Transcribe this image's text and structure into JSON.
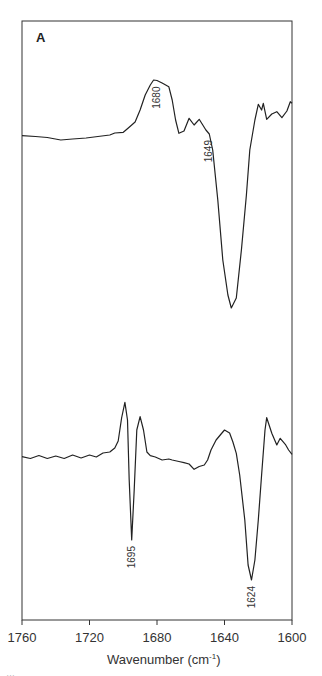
{
  "chart_data": {
    "type": "line",
    "title": "",
    "panel_label": "A",
    "xlabel": "Wavenumber (cm⁻¹)",
    "xlabel_main": "Wavenumber (cm",
    "xlabel_sup": "-1",
    "xlabel_close": ")",
    "ylabel": "",
    "xlim": [
      1760,
      1600
    ],
    "x_reversed": true,
    "xticks": [
      1760,
      1720,
      1680,
      1640,
      1600
    ],
    "xtick_labels": [
      "1760",
      "1720",
      "1680",
      "1640",
      "1600"
    ],
    "grid": false,
    "legend": null,
    "y_units": "relative absorbance (arbitrary, pixel-scaled; up = positive)",
    "series": [
      {
        "name": "upper spectrum",
        "points": [
          [
            1760,
            135.7
          ],
          [
            1752,
            136.5
          ],
          [
            1745,
            137.5
          ],
          [
            1737,
            140
          ],
          [
            1730,
            139
          ],
          [
            1722,
            138
          ],
          [
            1715,
            136.5
          ],
          [
            1708,
            135
          ],
          [
            1705,
            133
          ],
          [
            1700,
            132.3
          ],
          [
            1697,
            128
          ],
          [
            1693,
            122
          ],
          [
            1690,
            110
          ],
          [
            1687,
            95
          ],
          [
            1684,
            85
          ],
          [
            1682,
            80
          ],
          [
            1680,
            80.5
          ],
          [
            1677,
            83
          ],
          [
            1673,
            86.7
          ],
          [
            1671,
            100
          ],
          [
            1669,
            120
          ],
          [
            1667,
            133.3
          ],
          [
            1664,
            131
          ],
          [
            1661,
            118.3
          ],
          [
            1658,
            125
          ],
          [
            1655,
            119.3
          ],
          [
            1651,
            130
          ],
          [
            1649,
            134
          ],
          [
            1647,
            150
          ],
          [
            1644,
            200
          ],
          [
            1641,
            260
          ],
          [
            1638,
            295
          ],
          [
            1636,
            308
          ],
          [
            1633,
            298
          ],
          [
            1630,
            250
          ],
          [
            1627,
            195
          ],
          [
            1625,
            150
          ],
          [
            1622,
            120
          ],
          [
            1620,
            104.3
          ],
          [
            1618,
            110
          ],
          [
            1617,
            103.3
          ],
          [
            1615,
            119.3
          ],
          [
            1612,
            114
          ],
          [
            1609,
            111.7
          ],
          [
            1606,
            117.7
          ],
          [
            1603,
            111
          ],
          [
            1601,
            101.7
          ],
          [
            1600,
            103.3
          ]
        ]
      },
      {
        "name": "lower spectrum",
        "points": [
          [
            1760,
            456.7
          ],
          [
            1755,
            458.5
          ],
          [
            1750,
            455.5
          ],
          [
            1745,
            458.5
          ],
          [
            1740,
            456
          ],
          [
            1735,
            458.5
          ],
          [
            1730,
            455
          ],
          [
            1725,
            458
          ],
          [
            1720,
            455
          ],
          [
            1716,
            457
          ],
          [
            1712,
            453
          ],
          [
            1708,
            452
          ],
          [
            1705,
            448
          ],
          [
            1703,
            441
          ],
          [
            1701,
            418
          ],
          [
            1699,
            402.3
          ],
          [
            1697.5,
            420
          ],
          [
            1696.5,
            480
          ],
          [
            1695,
            540
          ],
          [
            1693.5,
            490
          ],
          [
            1692,
            430
          ],
          [
            1690,
            416.7
          ],
          [
            1688,
            430
          ],
          [
            1686,
            452
          ],
          [
            1684,
            455.7
          ],
          [
            1681,
            457
          ],
          [
            1677,
            460
          ],
          [
            1673,
            459
          ],
          [
            1671,
            460
          ],
          [
            1667,
            461.5
          ],
          [
            1664,
            462.7
          ],
          [
            1661,
            464
          ],
          [
            1658,
            469.3
          ],
          [
            1655,
            466.5
          ],
          [
            1652,
            465
          ],
          [
            1650,
            460
          ],
          [
            1648,
            450
          ],
          [
            1645,
            440
          ],
          [
            1642,
            434
          ],
          [
            1640,
            430
          ],
          [
            1637,
            433
          ],
          [
            1635,
            442
          ],
          [
            1633,
            453.3
          ],
          [
            1631,
            475
          ],
          [
            1628,
            520
          ],
          [
            1626,
            565
          ],
          [
            1624,
            580
          ],
          [
            1622,
            560
          ],
          [
            1620,
            520
          ],
          [
            1618,
            475
          ],
          [
            1616,
            430
          ],
          [
            1615,
            417.7
          ],
          [
            1612,
            433.3
          ],
          [
            1609,
            445
          ],
          [
            1607,
            438.3
          ],
          [
            1604,
            444.3
          ],
          [
            1602,
            450
          ],
          [
            1600,
            454.3
          ]
        ]
      }
    ],
    "annotations": [
      {
        "text": "1680",
        "series": "upper spectrum",
        "x": 1680,
        "kind": "band minimum",
        "rotated": true
      },
      {
        "text": "1649",
        "series": "upper spectrum",
        "x": 1649,
        "kind": "band minimum",
        "rotated": true
      },
      {
        "text": "1695",
        "series": "lower spectrum",
        "x": 1695,
        "kind": "band minimum",
        "rotated": true
      },
      {
        "text": "1624",
        "series": "lower spectrum",
        "x": 1624,
        "kind": "band minimum",
        "rotated": true
      }
    ]
  },
  "caption_fragment": "…"
}
